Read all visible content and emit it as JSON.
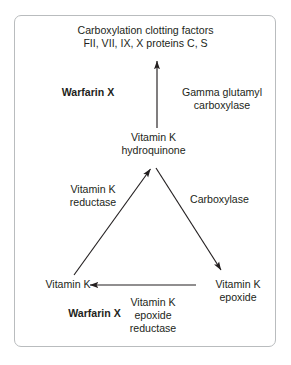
{
  "figure": {
    "border_color": "#b9bcbe",
    "text_color": "#231f20",
    "line_color": "#231f20",
    "background": "#ffffff"
  },
  "nodes": {
    "clotting_factors": {
      "line1": "Carboxylation clotting factors",
      "line2": "FII, VII, IX, X proteins C, S"
    },
    "vitamin_k_hydroquinone": {
      "line1": "Vitamin K",
      "line2": "hydroquinone"
    },
    "vitamin_k": {
      "line1": "Vitamin K"
    },
    "vitamin_k_epoxide": {
      "line1": "Vitamin K",
      "line2": "epoxide"
    }
  },
  "enzyme_labels": {
    "gamma_glutamyl_carboxylase": {
      "line1": "Gamma glutamyl",
      "line2": "carboxylase"
    },
    "vitamin_k_reductase": {
      "line1": "Vitamin K",
      "line2": "reductase"
    },
    "carboxylase": {
      "line1": "Carboxylase"
    },
    "vitamin_k_epoxide_reductase": {
      "line1": "Vitamin K",
      "line2": "epoxide",
      "line3": "reductase"
    }
  },
  "inhibitors": {
    "warfarin_top": "Warfarin X",
    "warfarin_bottom": "Warfarin X"
  },
  "arrows": [
    {
      "name": "hydroquinone-to-clotting-factors",
      "from": "Vitamin K hydroquinone",
      "to": "Carboxylation clotting factors",
      "direction": "up"
    },
    {
      "name": "vitamin-k-to-hydroquinone",
      "from": "Vitamin K",
      "to": "Vitamin K hydroquinone",
      "direction": "up-right"
    },
    {
      "name": "hydroquinone-to-epoxide",
      "from": "Vitamin K hydroquinone",
      "to": "Vitamin K epoxide",
      "direction": "down-right"
    },
    {
      "name": "epoxide-to-vitamin-k",
      "from": "Vitamin K epoxide",
      "to": "Vitamin K",
      "direction": "left"
    }
  ]
}
